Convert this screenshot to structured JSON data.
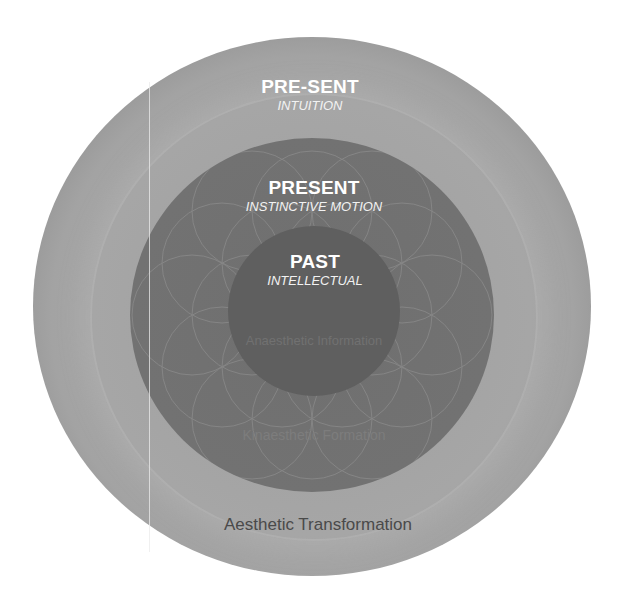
{
  "diagram": {
    "type": "concentric-circles",
    "rings": [
      {
        "level": "outer",
        "title": "PRE-SENT",
        "subtitle": "INTUITION",
        "bottom_label": "Aesthetic Transformation",
        "color": "#a3a3a3"
      },
      {
        "level": "middle",
        "title": "PRESENT",
        "subtitle": "INSTINCTIVE MOTION",
        "bottom_label": "Kinaesthetic Formation",
        "color": "#737373"
      },
      {
        "level": "inner",
        "title": "PAST",
        "subtitle": "INTELLECTUAL",
        "bottom_label": "Anaesthetic Information",
        "color": "#5f5f5f"
      }
    ],
    "decoration": "flower-of-life-pattern"
  }
}
